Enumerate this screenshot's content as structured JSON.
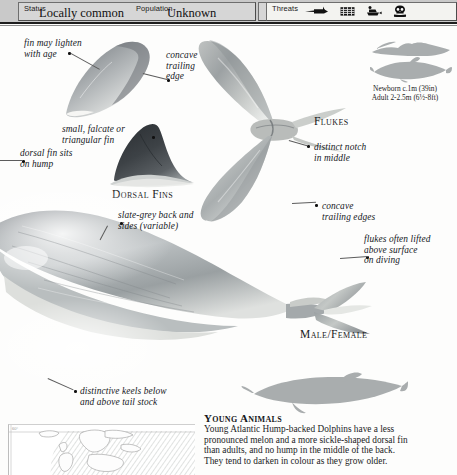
{
  "header": {
    "status": {
      "label": "Status",
      "value": "Locally common"
    },
    "population": {
      "label": "Population",
      "value": "Unknown"
    },
    "threats": {
      "label": "Threats",
      "icons": [
        {
          "name": "harpoon-icon",
          "title": "harpoon / direct hunting"
        },
        {
          "name": "net-icon",
          "title": "net entanglement"
        },
        {
          "name": "boat-icon",
          "title": "boat traffic"
        },
        {
          "name": "pollution-skull-icon",
          "title": "pollution"
        }
      ]
    }
  },
  "annotations": {
    "fin_lighten": "fin may lighten\nwith age",
    "concave_trailing_edge": "concave\ntrailing\nedge",
    "small_falcate": "small, falcate or\ntriangular fin",
    "dorsal_on_hump": "dorsal fin sits\non hump",
    "distinct_notch": "distinct notch\nin middle",
    "concave_trailing_edges": "concave\ntrailing edges",
    "slate_grey": "slate-grey back and\nsides (variable)",
    "flukes_lifted": "flukes often lifted\nabove surface\non diving",
    "keels": "distinctive keels below\nand above tail stock"
  },
  "figure_labels": {
    "dorsal_fins": "Dorsal Fins",
    "flukes": "Flukes",
    "male_female": "Male/Female"
  },
  "size_comparison": {
    "newborn": "Newborn c.1m (39in)",
    "adult": "Adult 2-2.5m (6½-8ft)"
  },
  "young_animals": {
    "title": "Young Animals",
    "body": "Young Atlantic Hump-backed Dolphins have a less\npronounced melon and a more sickle-shaped dorsal fin\nthan adults, and no hump in the middle of the back.\nThey tend to darken in colour as they grow older."
  },
  "map": {
    "tick_label": "60°"
  },
  "colors": {
    "bar_background": "#c9c9c9",
    "cell_background": "#d6d6d6",
    "body_grey": "#8e9398",
    "silhouette_grey": "#aaadae",
    "ink": "#15181c"
  }
}
